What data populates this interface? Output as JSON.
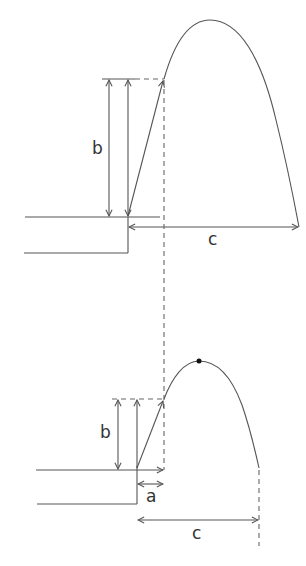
{
  "diagram": {
    "colors": {
      "line": "#555555",
      "dash": "#666666",
      "text": "#333333",
      "background": "#ffffff"
    },
    "top": {
      "labels": {
        "height": "b",
        "range": "c"
      },
      "launch_point": [
        128,
        217
      ],
      "release_point": [
        164,
        79
      ],
      "apex": [
        210,
        20
      ],
      "landing_point": [
        299,
        227
      ]
    },
    "bottom": {
      "labels": {
        "height": "b",
        "offset": "a",
        "range": "c"
      },
      "launch_point": [
        137,
        470
      ],
      "release_point": [
        164,
        399
      ],
      "apex_dot": [
        199,
        361
      ],
      "landing_point": [
        259,
        468
      ]
    },
    "shared": {
      "dashed_vertical_x": 164
    }
  }
}
